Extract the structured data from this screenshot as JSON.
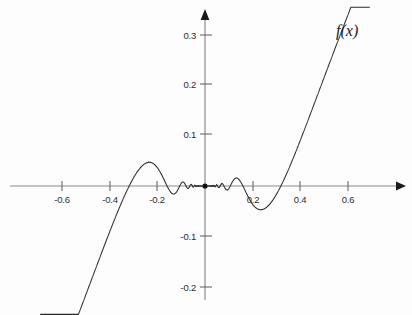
{
  "figure": {
    "curve_label": "f(x)",
    "background_color": "#fdfdfd",
    "curve_color": "#2a2a2a",
    "axis_color": "#8c8c8c",
    "tick_text_color": "#2b2b2b"
  },
  "axes": {
    "x_tick_labels": [
      "-0.6",
      "-0.4",
      "-0.2",
      "0.2",
      "0.4",
      "0.6"
    ],
    "x_tick_values": [
      -0.6,
      -0.4,
      -0.2,
      0.2,
      0.4,
      0.6
    ],
    "y_tick_labels": [
      "0.3",
      "0.2",
      "0.1",
      "-0.1",
      "-0.2"
    ],
    "y_tick_values": [
      0.3,
      0.2,
      0.1,
      -0.1,
      -0.2
    ],
    "x_arrow": "right-arrow-icon",
    "y_arrow": "up-arrow-icon",
    "origin_marker": "origin-dot"
  },
  "chart_data": {
    "type": "line",
    "title": "",
    "subtitle": "",
    "xlabel": "",
    "ylabel": "",
    "legend": [
      "f(x)"
    ],
    "legend_position": "top-right",
    "grid": false,
    "xlim": [
      -0.69,
      0.69
    ],
    "ylim": [
      -0.235,
      0.335
    ],
    "xticks": [
      -0.6,
      -0.4,
      -0.2,
      0.2,
      0.4,
      0.6
    ],
    "yticks": [
      0.3,
      0.2,
      0.1,
      -0.1,
      -0.2
    ],
    "annotations": [
      {
        "text": "f(x)",
        "x": 0.55,
        "y": 0.3
      }
    ],
    "series": [
      {
        "name": "f(x)",
        "formula": "x^2 * sin(1/x)",
        "description": "Quadratic envelope x^2 modulating sin(1/x); infinitely many oscillations accumulating at x = 0, amplitude vanishing at the origin; steep parabolic arms beyond |x| > 0.56",
        "envelope": "y = +/- x^2",
        "x": [
          -0.69,
          -0.65,
          -0.6,
          -0.56,
          -0.5,
          -0.47,
          -0.44,
          -0.4,
          -0.37,
          -0.35,
          -0.33,
          -0.3,
          -0.27,
          -0.25,
          -0.23,
          -0.21,
          -0.19,
          -0.17,
          -0.15,
          -0.13,
          -0.11,
          -0.09,
          -0.07,
          -0.05,
          -0.03,
          -0.015,
          0.0,
          0.015,
          0.03,
          0.05,
          0.07,
          0.09,
          0.11,
          0.13,
          0.15,
          0.17,
          0.19,
          0.21,
          0.23,
          0.25,
          0.27,
          0.3,
          0.33,
          0.35,
          0.37,
          0.4,
          0.44,
          0.47,
          0.5,
          0.56,
          0.6,
          0.65,
          0.69
        ],
        "y": [
          0.333,
          0.23,
          0.12,
          0.0,
          -0.176,
          -0.215,
          -0.196,
          -0.092,
          0.06,
          0.11,
          0.125,
          0.061,
          -0.057,
          -0.09,
          -0.06,
          0.016,
          0.043,
          0.026,
          -0.016,
          -0.017,
          0.012,
          0.008,
          -0.005,
          0.002,
          0.0009,
          -0.0002,
          0.0,
          0.0002,
          -0.0009,
          -0.002,
          0.005,
          -0.008,
          -0.012,
          0.017,
          0.016,
          -0.026,
          -0.043,
          -0.016,
          0.06,
          0.09,
          0.057,
          -0.061,
          -0.125,
          -0.11,
          -0.06,
          0.092,
          0.196,
          0.215,
          0.176,
          0.0,
          -0.12,
          -0.23,
          -0.333
        ],
        "key_features": {
          "max_local_peak_left": {
            "x": -0.33,
            "y": 0.125
          },
          "min_local_trough_left": {
            "x": -0.47,
            "y": -0.215
          },
          "max_local_peak_right": {
            "x": 0.33,
            "y": -0.125
          },
          "min_local_trough_right": {
            "x": 0.47,
            "y": 0.215
          },
          "zero_at_origin": {
            "x": 0.0,
            "y": 0.0
          }
        }
      }
    ]
  }
}
